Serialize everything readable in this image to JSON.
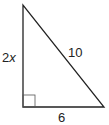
{
  "diagram": {
    "type": "right-triangle",
    "labels": {
      "left_side_coef": "2",
      "left_side_var": "x",
      "hypotenuse": "10",
      "bottom_side": "6"
    },
    "right_angle_marker": true,
    "stroke_color": "#222222"
  }
}
